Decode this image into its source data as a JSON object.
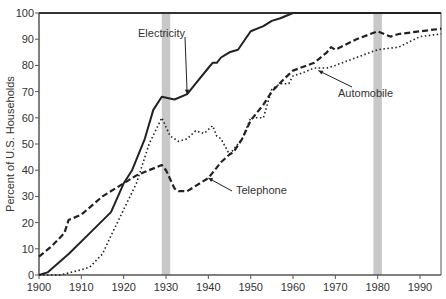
{
  "chart_data": {
    "type": "line",
    "title": "",
    "xlabel": "",
    "ylabel": "Percent of U.S. Households",
    "xlim": [
      1900,
      1995
    ],
    "ylim": [
      0,
      100
    ],
    "xticks": [
      1900,
      1910,
      1920,
      1930,
      1940,
      1950,
      1960,
      1970,
      1980,
      1990
    ],
    "yticks": [
      0,
      10,
      20,
      30,
      40,
      50,
      60,
      70,
      80,
      90,
      100
    ],
    "grid": false,
    "legend": "inline annotations",
    "shaded_bands": [
      {
        "x0": 1929,
        "x1": 1931,
        "color": "#c8c8c8"
      },
      {
        "x0": 1979,
        "x1": 1981,
        "color": "#c8c8c8"
      }
    ],
    "series": [
      {
        "name": "Electricity",
        "style": "solid",
        "x": [
          1900,
          1902,
          1907,
          1912,
          1917,
          1920,
          1922,
          1925,
          1927,
          1929,
          1932,
          1935,
          1937,
          1940,
          1941,
          1942,
          1943,
          1944,
          1945,
          1947,
          1950,
          1953,
          1955,
          1957,
          1960,
          1970,
          1980,
          1990,
          1995
        ],
        "values": [
          0,
          1,
          8,
          16,
          24,
          35,
          40,
          52,
          63,
          68,
          67,
          69,
          73,
          79,
          81,
          81,
          83,
          84,
          85,
          86,
          93,
          95,
          97,
          98,
          100,
          100,
          100,
          100,
          100
        ]
      },
      {
        "name": "Telephone",
        "style": "dashed",
        "x": [
          1900,
          1903,
          1906,
          1907,
          1910,
          1915,
          1920,
          1923,
          1926,
          1929,
          1930,
          1932,
          1933,
          1935,
          1940,
          1943,
          1945,
          1946,
          1948,
          1950,
          1953,
          1955,
          1958,
          1960,
          1965,
          1968,
          1969,
          1970,
          1975,
          1980,
          1983,
          1985,
          1990,
          1995
        ],
        "values": [
          7,
          11,
          16,
          21,
          23,
          30,
          35,
          38,
          40,
          42,
          40,
          33,
          32,
          32,
          37,
          43,
          46,
          47,
          52,
          59,
          65,
          70,
          75,
          78,
          81,
          85,
          87,
          86,
          90,
          93,
          91,
          92,
          93,
          94
        ]
      },
      {
        "name": "Automobile",
        "style": "dotted",
        "x": [
          1900,
          1905,
          1910,
          1912,
          1915,
          1917,
          1920,
          1923,
          1926,
          1929,
          1931,
          1933,
          1935,
          1937,
          1939,
          1941,
          1942,
          1943,
          1945,
          1948,
          1950,
          1953,
          1955,
          1957,
          1959,
          1960,
          1962,
          1965,
          1968,
          1970,
          1975,
          1980,
          1985,
          1990,
          1995
        ],
        "values": [
          0,
          0,
          2,
          3,
          8,
          15,
          25,
          35,
          50,
          60,
          53,
          51,
          52,
          55,
          54,
          57,
          53,
          52,
          46,
          52,
          60,
          60,
          71,
          73,
          73,
          76,
          77,
          79,
          79,
          80,
          83,
          86,
          87,
          91,
          92
        ]
      }
    ],
    "annotations": [
      {
        "text": "Electricity",
        "arrow_to": [
          1935,
          69
        ]
      },
      {
        "text": "Telephone",
        "arrow_to": [
          1940,
          37
        ]
      },
      {
        "text": "Automobile",
        "arrow_to": [
          1966,
          78
        ]
      }
    ]
  }
}
